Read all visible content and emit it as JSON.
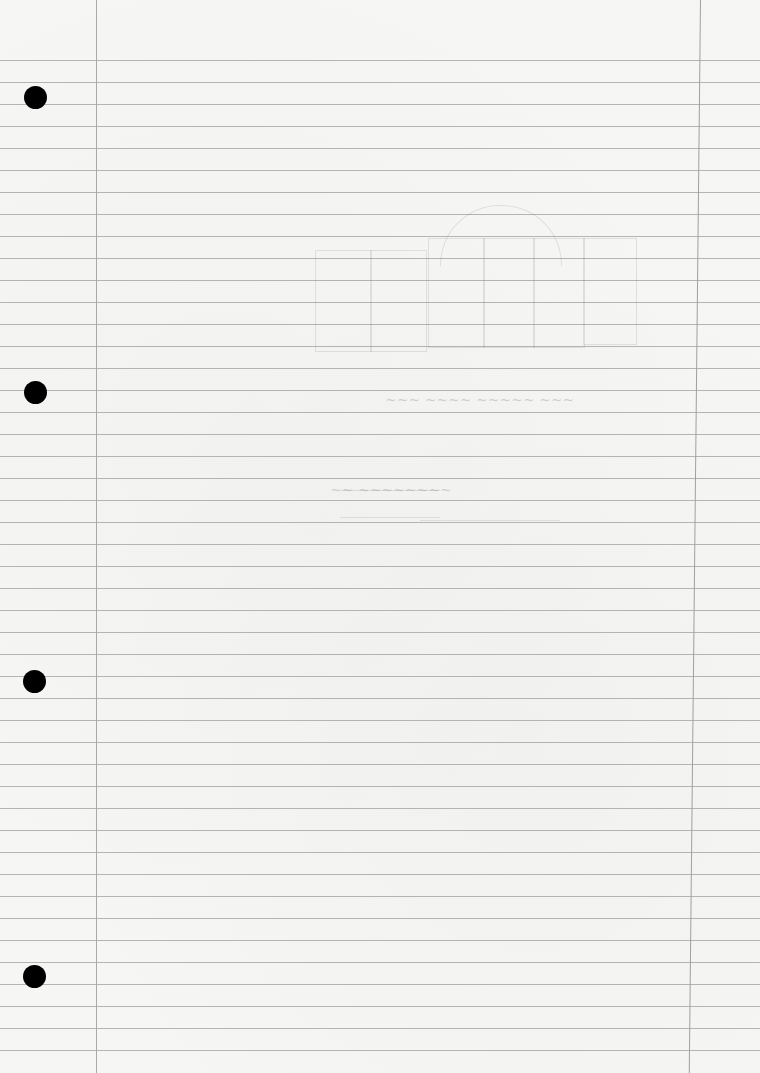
{
  "page": {
    "type": "lined-notebook-paper",
    "paper_color": "#f6f6f5",
    "rule_color": "#b4b4b4",
    "margin_color": "#a9a9a9",
    "rule_start_y": 60,
    "rule_spacing": 22,
    "rule_count": 46,
    "left_margin_x": 96,
    "right_margin_x": 700,
    "punch_holes": [
      {
        "x": 35,
        "y": 97
      },
      {
        "x": 35,
        "y": 392
      },
      {
        "x": 34,
        "y": 681
      },
      {
        "x": 34,
        "y": 976
      }
    ],
    "handwriting": {
      "legible": false,
      "description": "faint erased pencil marks and a sketched grid, illegible"
    }
  }
}
